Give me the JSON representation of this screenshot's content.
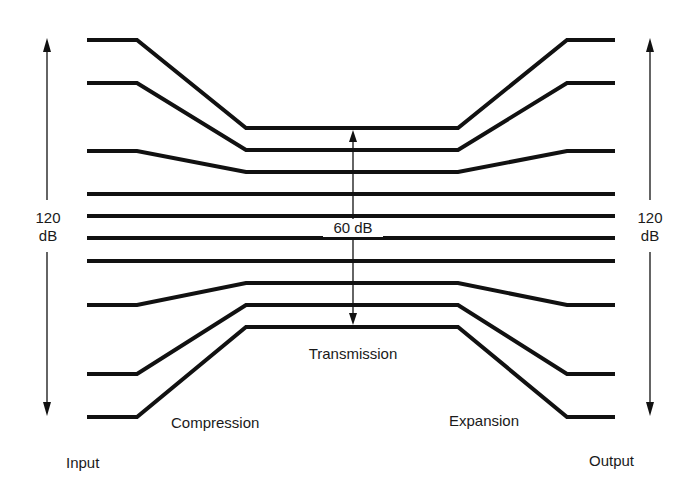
{
  "diagram": {
    "labels": {
      "left_range_value": "120",
      "left_range_unit": "dB",
      "right_range_value": "120",
      "right_range_unit": "dB",
      "center_range": "60 dB",
      "transmission": "Transmission",
      "compression": "Compression",
      "expansion": "Expansion",
      "input": "Input",
      "output": "Output"
    },
    "level_lines": {
      "input_y": [
        40,
        83,
        151,
        194,
        216,
        238,
        261,
        305,
        374,
        417
      ],
      "transmission_y": [
        128,
        150,
        172,
        194,
        216,
        238,
        261,
        283,
        305,
        327
      ],
      "output_y": [
        40,
        83,
        151,
        194,
        216,
        238,
        261,
        305,
        374,
        417
      ],
      "x_points": [
        87,
        137,
        246,
        458,
        567,
        615
      ]
    },
    "colors": {
      "line": "#111111",
      "background": "#ffffff",
      "text": "#1a1a1a"
    }
  }
}
